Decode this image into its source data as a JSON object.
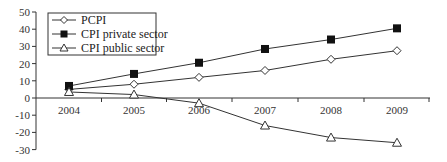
{
  "chart_data": {
    "type": "line",
    "title": "",
    "xlabel": "",
    "ylabel": "",
    "categories": [
      "2004",
      "2005",
      "2006",
      "2007",
      "2008",
      "2009"
    ],
    "ylim": [
      -30,
      50
    ],
    "yticks": [
      50,
      40,
      30,
      20,
      10,
      0,
      -10,
      -20,
      -30
    ],
    "grid": false,
    "legend_position": "upper-left",
    "series": [
      {
        "name": "PCPI",
        "marker": "open-diamond",
        "values": [
          5,
          8,
          12,
          16,
          22.5,
          27.5
        ]
      },
      {
        "name": "CPI private sector",
        "marker": "filled-square",
        "values": [
          7,
          14,
          20.5,
          28.5,
          34,
          40.5
        ]
      },
      {
        "name": "CPI public sector",
        "marker": "open-triangle",
        "values": [
          3.5,
          2,
          -3,
          -16,
          -23,
          -26
        ]
      }
    ]
  },
  "legend": {
    "items": [
      {
        "label": "PCPI"
      },
      {
        "label": "CPI private sector"
      },
      {
        "label": "CPI public sector"
      }
    ]
  }
}
